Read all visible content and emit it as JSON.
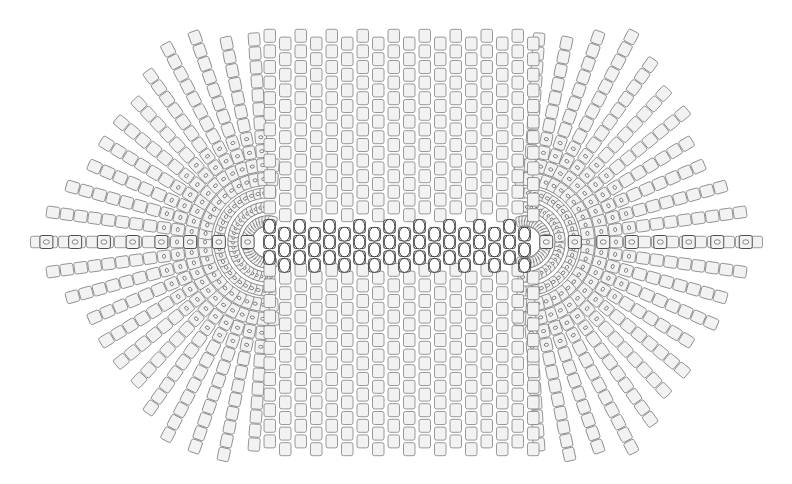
{
  "document": {
    "title": "Geometric Tiling Diagram",
    "background_color": "#ffffff",
    "width": 792,
    "height": 484
  },
  "palette": {
    "tile_fill": "#f2f2f2",
    "tile_stroke": "#808080",
    "tile_stroke_dark": "#4d4d4d",
    "inner_mark_fill": "#fafafa",
    "inner_mark_stroke": "#555555",
    "center_band_stroke": "#3a3a3a",
    "background": "#ffffff"
  },
  "figure": {
    "name": "hexagonal-tile-field",
    "outline_shape": "hexagon",
    "left_tip_x": 32,
    "right_tip_x": 760,
    "spine_y": 242,
    "top_edge_y": 30,
    "bottom_edge_y": 455,
    "top_edge_x_start": 178,
    "top_edge_x_end": 632
  },
  "regions": [
    {
      "name": "left-fan",
      "kind": "radial",
      "focus_x": 268,
      "focus_y": 242,
      "inner_radius": 14,
      "outer_radius": 252,
      "ray_count": 46,
      "rings": 17,
      "angle_span_deg": 360
    },
    {
      "name": "right-fan",
      "kind": "radial",
      "focus_x": 525,
      "focus_y": 242,
      "inner_radius": 14,
      "outer_radius": 252,
      "ray_count": 46,
      "rings": 17,
      "angle_span_deg": 360
    },
    {
      "name": "center-grid",
      "kind": "cartesian",
      "x_start": 262,
      "x_end": 532,
      "y_start": 28,
      "y_end": 458,
      "column_pitch": 15.5,
      "row_pitch": 15.6,
      "columns": 18,
      "rows": 28
    },
    {
      "name": "center-band",
      "kind": "ellipse-band",
      "x_start": 262,
      "x_end": 532,
      "y_center": 242,
      "rows": 3,
      "row_pitch": 15.6,
      "ellipse_rx": 5.4,
      "ellipse_ry": 7.0,
      "columns": 18
    },
    {
      "name": "left-spine",
      "kind": "horizontal-run",
      "x_start": 32,
      "x_end": 262,
      "y": 242,
      "tiles": 8
    },
    {
      "name": "right-spine",
      "kind": "horizontal-run",
      "x_start": 532,
      "x_end": 760,
      "y": 242,
      "tiles": 8
    }
  ],
  "tile": {
    "shape": "rounded-rectangle",
    "width": 11.5,
    "height": 13.0,
    "corner_radius": 2.0,
    "stroke_width": 0.8,
    "inner_mark_shape": "ellipse",
    "inner_mark_rx": 2.1,
    "inner_mark_ry": 1.5
  },
  "counts": {
    "total_tiles_approx": 2150,
    "fan_tiles_approx": 1180,
    "grid_tiles_approx": 470,
    "band_tiles": 54
  }
}
